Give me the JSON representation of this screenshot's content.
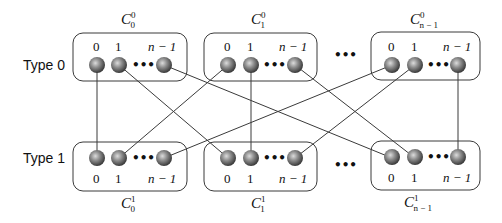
{
  "rows": [
    {
      "label": "Type 0"
    },
    {
      "label": "Type 1"
    }
  ],
  "top_clusters": [
    {
      "name": "C",
      "sup": "0",
      "sub": "0",
      "indices": [
        "0",
        "1",
        "n − 1"
      ]
    },
    {
      "name": "C",
      "sup": "0",
      "sub": "1",
      "indices": [
        "0",
        "1",
        "n − 1"
      ]
    },
    {
      "name": "C",
      "sup": "0",
      "sub": "n − 1",
      "indices": [
        "0",
        "1",
        "n − 1"
      ]
    }
  ],
  "bottom_clusters": [
    {
      "name": "C",
      "sup": "1",
      "sub": "0",
      "indices": [
        "0",
        "1",
        "n − 1"
      ]
    },
    {
      "name": "C",
      "sup": "1",
      "sub": "1",
      "indices": [
        "0",
        "1",
        "n − 1"
      ]
    },
    {
      "name": "C",
      "sup": "1",
      "sub": "n − 1",
      "indices": [
        "0",
        "1",
        "n − 1"
      ]
    }
  ],
  "ellipsis": "•••",
  "edges": [
    {
      "from": "C0_0.node0",
      "to": "C1_0.node0"
    },
    {
      "from": "C0_0.node1",
      "to": "C1_1.node0"
    },
    {
      "from": "C0_0.node(n-1)",
      "to": "C1_(n-1).node0"
    },
    {
      "from": "C0_1.node0",
      "to": "C1_0.node1"
    },
    {
      "from": "C0_1.node1",
      "to": "C1_1.node1"
    },
    {
      "from": "C0_1.node(n-1)",
      "to": "C1_(n-1).node1"
    },
    {
      "from": "C0_(n-1).node0",
      "to": "C1_0.node(n-1)"
    },
    {
      "from": "C0_(n-1).node1",
      "to": "C1_1.node(n-1)"
    },
    {
      "from": "C0_(n-1).node(n-1)",
      "to": "C1_(n-1).node(n-1)"
    }
  ],
  "colors": {
    "node_highlight": "#d8d8d8",
    "node_mid": "#8a8a8a",
    "node_edge": "#3c3c3c",
    "stroke": "#3a3a3a"
  }
}
